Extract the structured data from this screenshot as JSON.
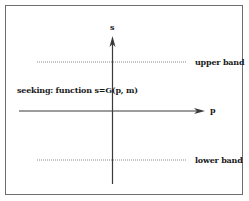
{
  "diagram": {
    "axes": {
      "vertical_label": "s",
      "horizontal_label": "p"
    },
    "bands": {
      "upper_label": "upper band",
      "lower_label": "lower band"
    },
    "annotation": "seeking: function s=G(p, m)",
    "colors": {
      "line": "#3a3a3a",
      "dotted": "#8a8a8a",
      "frame": "#6e6e6e",
      "background": "#ffffff"
    }
  }
}
